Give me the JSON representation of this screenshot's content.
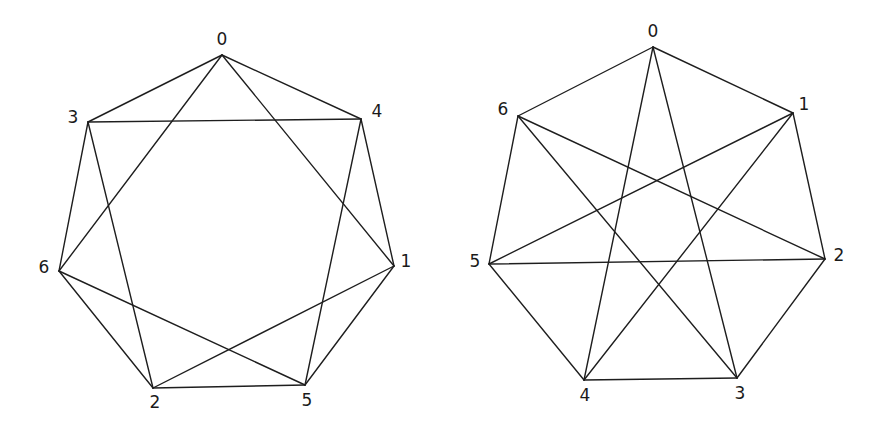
{
  "figure": {
    "width": 887,
    "height": 439,
    "stroke_color": "#1e1e1e",
    "background": "#ffffff"
  },
  "graphs": [
    {
      "id": "left",
      "description": "4-regular circulant graph on 7 vertices (heptagon with chords), labelled 0,4,1,5,2,6,3 clockwise from top",
      "vertices": [
        {
          "label": "0",
          "x": 222,
          "y": 55,
          "lx": 222,
          "ly": 40
        },
        {
          "label": "4",
          "x": 361,
          "y": 119,
          "lx": 377,
          "ly": 112
        },
        {
          "label": "1",
          "x": 394,
          "y": 266,
          "lx": 406,
          "ly": 262
        },
        {
          "label": "5",
          "x": 305,
          "y": 385,
          "lx": 307,
          "ly": 401
        },
        {
          "label": "2",
          "x": 153,
          "y": 388,
          "lx": 155,
          "ly": 403
        },
        {
          "label": "6",
          "x": 59,
          "y": 271,
          "lx": 44,
          "ly": 268
        },
        {
          "label": "3",
          "x": 88,
          "y": 122,
          "lx": 73,
          "ly": 118
        }
      ],
      "edges": [
        [
          "0",
          "3"
        ],
        [
          "0",
          "4"
        ],
        [
          "0",
          "6"
        ],
        [
          "0",
          "1"
        ],
        [
          "3",
          "4"
        ],
        [
          "3",
          "6"
        ],
        [
          "3",
          "2"
        ],
        [
          "4",
          "1"
        ],
        [
          "4",
          "5"
        ],
        [
          "1",
          "5"
        ],
        [
          "1",
          "2"
        ],
        [
          "6",
          "2"
        ],
        [
          "6",
          "5"
        ],
        [
          "2",
          "5"
        ]
      ]
    },
    {
      "id": "right",
      "description": "4-regular circulant graph on 7 vertices (heptagon with star chords), labelled 0..6 clockwise from top",
      "vertices": [
        {
          "label": "0",
          "x": 653,
          "y": 47,
          "lx": 653,
          "ly": 32
        },
        {
          "label": "1",
          "x": 793,
          "y": 113,
          "lx": 804,
          "ly": 105
        },
        {
          "label": "2",
          "x": 825,
          "y": 259,
          "lx": 839,
          "ly": 256
        },
        {
          "label": "3",
          "x": 737,
          "y": 378,
          "lx": 740,
          "ly": 394
        },
        {
          "label": "4",
          "x": 584,
          "y": 380,
          "lx": 585,
          "ly": 396
        },
        {
          "label": "5",
          "x": 489,
          "y": 264,
          "lx": 475,
          "ly": 262
        },
        {
          "label": "6",
          "x": 518,
          "y": 116,
          "lx": 503,
          "ly": 110
        }
      ],
      "edges": [
        [
          "0",
          "1"
        ],
        [
          "1",
          "2"
        ],
        [
          "2",
          "3"
        ],
        [
          "3",
          "4"
        ],
        [
          "4",
          "5"
        ],
        [
          "5",
          "6"
        ],
        [
          "6",
          "0"
        ],
        [
          "0",
          "4"
        ],
        [
          "0",
          "3"
        ],
        [
          "6",
          "3"
        ],
        [
          "6",
          "2"
        ],
        [
          "1",
          "5"
        ],
        [
          "1",
          "4"
        ],
        [
          "5",
          "2"
        ]
      ]
    }
  ]
}
